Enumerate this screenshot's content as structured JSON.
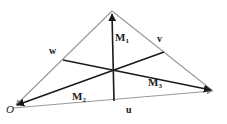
{
  "figure": {
    "background_color": "#ffffff",
    "width": 227,
    "height": 124
  },
  "colors": {
    "edge_stroke": "#9a9a9a",
    "median_stroke": "#1a1a1a",
    "label_color": "#1b1b1b"
  },
  "geometry": {
    "vertices": {
      "origin": {
        "x": 13,
        "y": 108
      },
      "apex": {
        "x": 112,
        "y": 11
      },
      "right": {
        "x": 215,
        "y": 92
      }
    },
    "midpoints": {
      "bottom_side": {
        "x": 114,
        "y": 100
      },
      "left_side": {
        "x": 63,
        "y": 60
      },
      "right_side": {
        "x": 164,
        "y": 52
      }
    },
    "centroid": {
      "x": 113,
      "y": 73
    }
  },
  "labels": {
    "origin": {
      "text": "O",
      "x": 6,
      "y": 107,
      "style": "italic"
    },
    "vector_u": {
      "text": "u",
      "x": 126,
      "y": 105,
      "style": "bold"
    },
    "vector_v": {
      "text": "v",
      "x": 157,
      "y": 36,
      "style": "bold"
    },
    "vector_w": {
      "text": "w",
      "x": 49,
      "y": 47,
      "style": "bold"
    },
    "median_1": {
      "base": "M",
      "sub": "1",
      "x": 115,
      "y": 33
    },
    "median_2": {
      "base": "M",
      "sub": "2",
      "x": 72,
      "y": 92
    },
    "median_3": {
      "base": "M",
      "sub": "3",
      "x": 148,
      "y": 78
    }
  },
  "arrowheads": {
    "origin_from_apex": true,
    "origin_from_centroid": true,
    "apex_from_bottom_mid": true,
    "right_from_origin": true,
    "right_from_centroid": true
  }
}
